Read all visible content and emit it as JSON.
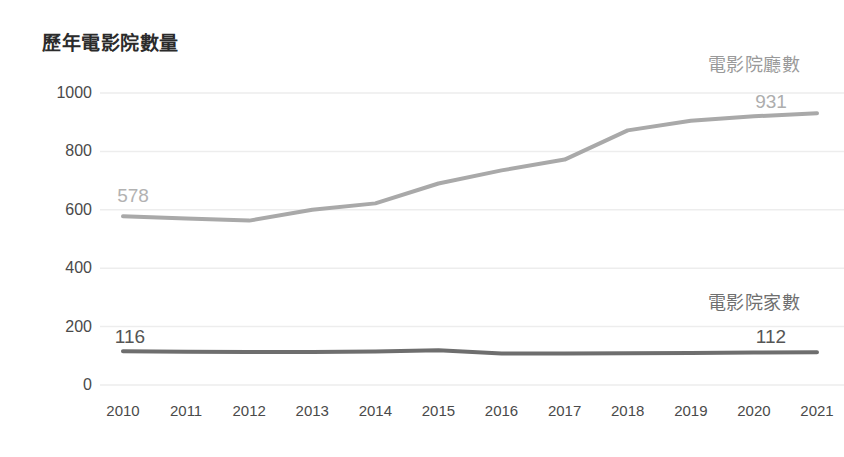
{
  "chart_data": {
    "type": "line",
    "title": "歷年電影院數量",
    "xlabel": "",
    "ylabel": "",
    "categories": [
      "2010",
      "2011",
      "2012",
      "2013",
      "2014",
      "2015",
      "2016",
      "2017",
      "2018",
      "2019",
      "2020",
      "2021"
    ],
    "ylim": [
      0,
      1000
    ],
    "yticks": [
      "0",
      "200",
      "400",
      "600",
      "800",
      "1000"
    ],
    "grid": true,
    "legend_position": "inline-right",
    "series": [
      {
        "name": "電影院廳數",
        "color": "#a9a9a9",
        "values": [
          578,
          570,
          563,
          600,
          622,
          690,
          735,
          772,
          872,
          905,
          920,
          931
        ],
        "start_label": "578",
        "end_label": "931"
      },
      {
        "name": "電影院家數",
        "color": "#6e6e6e",
        "values": [
          116,
          114,
          113,
          113,
          115,
          119,
          108,
          108,
          109,
          110,
          111,
          112
        ],
        "start_label": "116",
        "end_label": "112"
      }
    ],
    "annotations": [
      {
        "text": "電影院廳數",
        "role": "series-label-screens"
      },
      {
        "text": "931",
        "role": "series-end-value-screens"
      },
      {
        "text": "578",
        "role": "series-start-value-screens"
      },
      {
        "text": "電影院家數",
        "role": "series-label-cinemas"
      },
      {
        "text": "112",
        "role": "series-end-value-cinemas"
      },
      {
        "text": "116",
        "role": "series-start-value-cinemas"
      }
    ]
  },
  "colors": {
    "background": "#ffffff",
    "title": "#2b2b2b",
    "axis_text": "#4a4a4a",
    "gridline": "#ededed",
    "series_screens": "#a9a9a9",
    "series_cinemas": "#6e6e6e"
  }
}
